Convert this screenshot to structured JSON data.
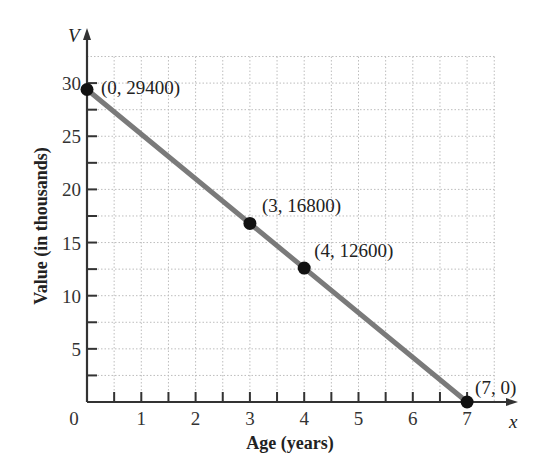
{
  "chart_data": {
    "type": "line",
    "title": "",
    "xlabel": "Age (years)",
    "ylabel": "Value (in thousands)",
    "x_var": "x",
    "y_var": "V",
    "xlim": [
      0,
      7.5
    ],
    "ylim": [
      0,
      32.5
    ],
    "x_ticks": [
      "0",
      "1",
      "2",
      "3",
      "4",
      "5",
      "6",
      "7"
    ],
    "y_ticks": [
      "5",
      "10",
      "15",
      "20",
      "25",
      "30"
    ],
    "grid": true,
    "series": [
      {
        "name": "Value",
        "x": [
          0,
          7
        ],
        "y": [
          29.4,
          0
        ],
        "color": "#7a7a7a"
      }
    ],
    "points": [
      {
        "x": 0,
        "y": 29400,
        "label": "(0, 29400)"
      },
      {
        "x": 3,
        "y": 16800,
        "label": "(3, 16800)"
      },
      {
        "x": 4,
        "y": 12600,
        "label": "(4, 12600)"
      },
      {
        "x": 7,
        "y": 0,
        "label": "(7, 0)"
      }
    ]
  }
}
